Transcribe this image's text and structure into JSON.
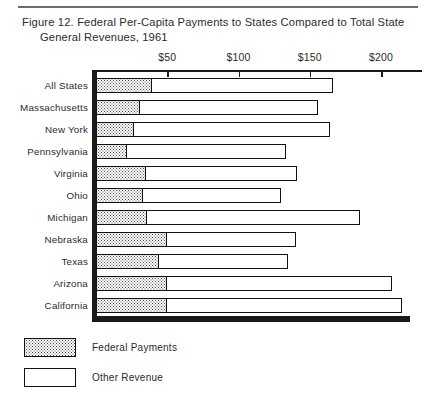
{
  "figure": {
    "title_line1": "Figure 12.  Federal Per-Capita Payments to States Compared to Total State",
    "title_line2": "General Revenues, 1961"
  },
  "legend": {
    "items": [
      {
        "label": "Federal Payments",
        "swatch": "hatched-dotted",
        "color": "#4a4a4a"
      },
      {
        "label": "Other Revenue",
        "swatch": "open-white",
        "color": "#ffffff"
      }
    ]
  },
  "axis": {
    "tick_labels": [
      "$50",
      "$100",
      "$150",
      "$200"
    ],
    "tick_values": [
      50,
      100,
      150,
      200
    ]
  },
  "chart_data": {
    "type": "bar",
    "orientation": "horizontal",
    "stacked": true,
    "title": "Figure 12.  Federal Per-Capita Payments to States Compared to Total State General Revenues, 1961",
    "xlabel": "",
    "ylabel": "",
    "xlim": [
      0,
      230
    ],
    "grid": false,
    "legend_position": "bottom-left",
    "categories": [
      "All States",
      "Massachusetts",
      "New York",
      "Pennsylvania",
      "Virginia",
      "Ohio",
      "Michigan",
      "Nebraska",
      "Texas",
      "Arizona",
      "California"
    ],
    "series": [
      {
        "name": "Federal Payments",
        "values": [
          39,
          31,
          27,
          22,
          35,
          33,
          36,
          50,
          44,
          50,
          50
        ]
      },
      {
        "name": "Other Revenue",
        "values": [
          127,
          125,
          137,
          111,
          106,
          97,
          149,
          90,
          91,
          158,
          165
        ]
      }
    ],
    "totals": [
      166,
      156,
      164,
      133,
      141,
      130,
      185,
      140,
      135,
      208,
      215
    ],
    "units": "dollars per capita"
  }
}
